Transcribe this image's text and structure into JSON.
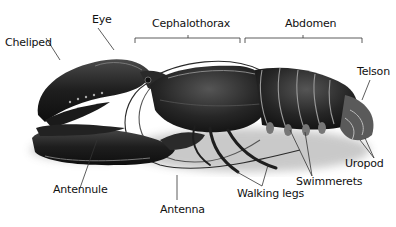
{
  "diagram": {
    "labels": {
      "cheliped": "Cheliped",
      "eye": "Eye",
      "cephalothorax": "Cephalothorax",
      "abdomen": "Abdomen",
      "telson": "Telson",
      "uropod": "Uropod",
      "swimmerets": "Swimmerets",
      "walking_legs": "Walking legs",
      "antenna": "Antenna",
      "antennule": "Antennule"
    },
    "colors": {
      "body_dark": "#1c1c1c",
      "body_mid": "#3a3a3a",
      "highlight": "#9a9a9a",
      "shadow": "#cfcfcf",
      "leader_line": "#333333",
      "text": "#111111"
    }
  }
}
